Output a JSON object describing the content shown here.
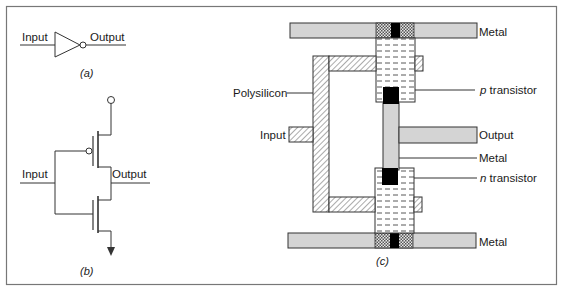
{
  "figure": {
    "panel_a": {
      "caption": "(a)",
      "input_label": "Input",
      "output_label": "Output",
      "symbol": "inverter-gate"
    },
    "panel_b": {
      "caption": "(b)",
      "input_label": "Input",
      "output_label": "Output",
      "symbol": "cmos-inverter-transistor-schematic"
    },
    "panel_c": {
      "caption": "(c)",
      "labels": {
        "metal_top": "Metal",
        "polysilicon": "Polysilicon",
        "p_transistor_italic": "p",
        "p_transistor_rest": " transistor",
        "input": "Input",
        "output": "Output",
        "metal_mid": "Metal",
        "n_transistor_italic": "n",
        "n_transistor_rest": " transistor",
        "metal_bottom": "Metal"
      }
    },
    "colors": {
      "metal_fill": "#d4d4d4",
      "contact_fill": "#000000",
      "line": "#333333",
      "frame": "#777777"
    }
  }
}
